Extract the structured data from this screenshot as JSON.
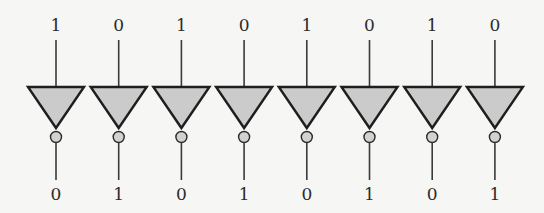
{
  "diagram": {
    "title": "",
    "gate_type": "NOT (inverter)",
    "gate_count": 8,
    "colors": {
      "background": "#f6f6f4",
      "gate_fill": "#cbcbcb",
      "stroke": "#1e1e1e",
      "bubble_fill": "#d2d2d2"
    },
    "gates": [
      {
        "input": "1",
        "output": "0"
      },
      {
        "input": "0",
        "output": "1"
      },
      {
        "input": "1",
        "output": "0"
      },
      {
        "input": "0",
        "output": "1"
      },
      {
        "input": "1",
        "output": "0"
      },
      {
        "input": "0",
        "output": "1"
      },
      {
        "input": "1",
        "output": "0"
      },
      {
        "input": "0",
        "output": "1"
      }
    ]
  }
}
